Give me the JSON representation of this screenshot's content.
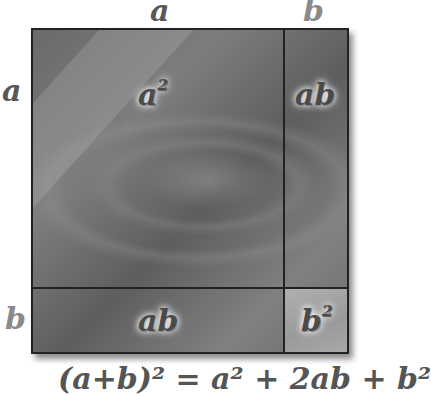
{
  "top_labels": {
    "a": "a",
    "b": "b"
  },
  "left_labels": {
    "a": "a",
    "b": "b"
  },
  "regions": {
    "a_squared": {
      "base": "a",
      "exp": "2"
    },
    "ab_right": "ab",
    "ab_bottom": "ab",
    "b_squared": {
      "base": "b",
      "exp": "2"
    }
  },
  "formula": "(a+b)² = a² + 2ab + b²",
  "colors": {
    "border": "#222222",
    "label": "#4a4a4a",
    "side_a": "#585858",
    "side_b": "#8a8a8a"
  }
}
